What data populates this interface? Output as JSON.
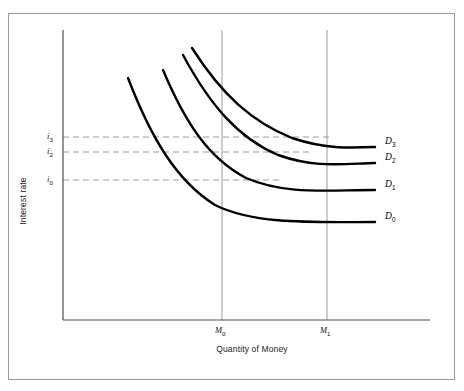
{
  "chart_data": {
    "type": "line",
    "title": "",
    "subtitle": "",
    "xlabel": "Quantity of Money",
    "ylabel": "Interest rate",
    "grid": false,
    "legend_position": "right-inline",
    "x_ticks": [
      {
        "label": "M",
        "sub": "0",
        "pixel_x": 222
      },
      {
        "label": "M",
        "sub": "1",
        "pixel_x": 327
      }
    ],
    "y_ticks": [
      {
        "label": "i",
        "sub": "3",
        "pixel_y": 137
      },
      {
        "label": "i",
        "sub": "2",
        "pixel_y": 152
      },
      {
        "label": "i",
        "sub": "0",
        "pixel_y": 180
      }
    ],
    "series": [
      {
        "name": "D",
        "sub": "0",
        "label_x": 385,
        "label_y": 218,
        "path": "M 128 78 C 150 135, 175 180, 215 205 C 255 225, 315 222, 375 222"
      },
      {
        "name": "D",
        "sub": "1",
        "label_x": 385,
        "label_y": 186,
        "path": "M 163 70 C 185 122, 208 158, 246 178 C 286 195, 325 190, 375 190"
      },
      {
        "name": "D",
        "sub": "2",
        "label_x": 385,
        "label_y": 159,
        "path": "M 183 55 C 210 105, 238 138, 278 155 C 315 168, 340 164, 375 163"
      },
      {
        "name": "D",
        "sub": "3",
        "label_x": 385,
        "label_y": 143,
        "path": "M 192 48 C 222 95, 252 122, 292 138 C 325 149, 348 148, 375 147"
      }
    ],
    "reference_lines": {
      "horizontal": [
        {
          "y": 137,
          "x_from": 63,
          "x_to": 330,
          "tick": "i3"
        },
        {
          "y": 152,
          "x_from": 63,
          "x_to": 312,
          "tick": "i2"
        },
        {
          "y": 180,
          "x_from": 63,
          "x_to": 283,
          "tick": "i0"
        }
      ],
      "vertical": [
        {
          "x": 222,
          "y_from": 30,
          "y_to": 320,
          "tick": "M0"
        },
        {
          "x": 327,
          "y_from": 30,
          "y_to": 320,
          "tick": "M1"
        }
      ]
    },
    "axes": {
      "x_axis_y": 320,
      "y_axis_x": 63,
      "x_axis_from": 63,
      "x_axis_to": 430,
      "y_axis_from": 30,
      "y_axis_to": 320
    },
    "colors": {
      "curve": "#000000",
      "axis": "#4d4d4d",
      "reference_line": "#9b9b9b",
      "border": "#9a9a9a",
      "background": "#ffffff",
      "text": "#111111"
    }
  }
}
